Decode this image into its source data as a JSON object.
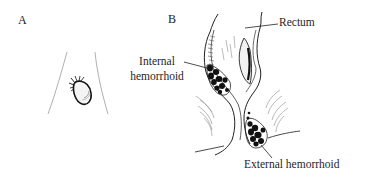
{
  "figure": {
    "panels": [
      {
        "id": "A",
        "letter": "A",
        "description": "External view of anus with hemorrhoid"
      },
      {
        "id": "B",
        "letter": "B",
        "description": "Cross-section of rectum and anal canal",
        "labels": {
          "rectum": "Rectum",
          "internal_line1": "Internal",
          "internal_line2": "hemorrhoid",
          "external": "External hemorrhoid"
        }
      }
    ]
  }
}
